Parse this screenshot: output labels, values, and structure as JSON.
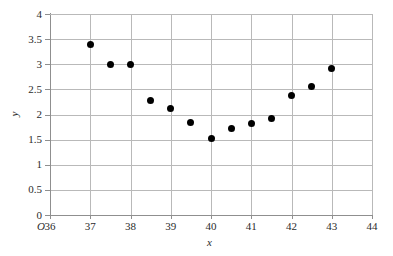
{
  "chart_data": {
    "type": "scatter",
    "title": "",
    "xlabel": "x",
    "ylabel": "y",
    "origin_label": "O",
    "xlim": [
      36,
      44
    ],
    "ylim": [
      0,
      4
    ],
    "grid": true,
    "legend": null,
    "marker_color": "#000000",
    "grid_color": "#b9b9b9",
    "axis_color": "#8f8f8f",
    "xticks": [
      36,
      37,
      38,
      39,
      40,
      41,
      42,
      43,
      44
    ],
    "xtick_labels": [
      "36",
      "37",
      "38",
      "39",
      "40",
      "41",
      "42",
      "43",
      "44"
    ],
    "yticks": [
      0,
      0.5,
      1,
      1.5,
      2,
      2.5,
      3,
      3.5,
      4
    ],
    "ytick_labels": [
      "0",
      "0.5",
      "1",
      "1.5",
      "2",
      "2.5",
      "3",
      "3.5",
      "4"
    ],
    "points": [
      {
        "x": 37.0,
        "y": 3.4
      },
      {
        "x": 37.5,
        "y": 3.0
      },
      {
        "x": 38.0,
        "y": 3.0
      },
      {
        "x": 38.5,
        "y": 2.27
      },
      {
        "x": 39.0,
        "y": 2.11
      },
      {
        "x": 39.5,
        "y": 1.84
      },
      {
        "x": 40.0,
        "y": 1.52
      },
      {
        "x": 40.5,
        "y": 1.73
      },
      {
        "x": 41.0,
        "y": 1.83
      },
      {
        "x": 41.5,
        "y": 1.92
      },
      {
        "x": 42.0,
        "y": 2.37
      },
      {
        "x": 42.5,
        "y": 2.55
      },
      {
        "x": 43.0,
        "y": 2.92
      }
    ]
  }
}
